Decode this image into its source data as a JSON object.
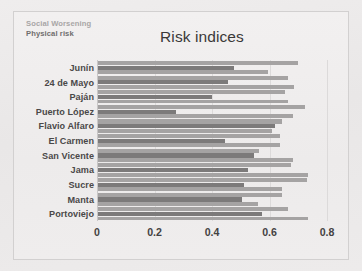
{
  "figure": {
    "title": "Risk indices",
    "legend": {
      "social_label": "Social Worsening",
      "physical_label": "Physical risk",
      "social_color": "#a5a3a3",
      "physical_color": "#7c7a7a"
    },
    "background_color": "#eceaea",
    "frame_border_color": "#d2d0d0"
  },
  "chart_data": {
    "type": "bar",
    "orientation": "horizontal",
    "title": "Risk indices",
    "xlabel": "",
    "ylabel": "",
    "xlim": [
      0,
      0.8
    ],
    "xticks": [
      "0",
      "0.2",
      "0.4",
      "0.6",
      "0.8"
    ],
    "xtick_values": [
      0,
      0.2,
      0.4,
      0.6,
      0.8
    ],
    "grid": true,
    "legend_position": "top-left",
    "categories": [
      "Junín",
      "24 de Mayo",
      "Paján",
      "Puerto López",
      "Flavio Alfaro",
      "El Carmen",
      "San Vicente",
      "Jama",
      "Sucre",
      "Manta",
      "Portoviejo"
    ],
    "series": [
      {
        "name": "Social Worsening",
        "color": "#a5a3a3",
        "values": [
          0.7,
          0.665,
          0.655,
          0.725,
          0.645,
          0.635,
          0.565,
          0.675,
          0.73,
          0.645,
          0.665
        ]
      },
      {
        "name": "Physical risk",
        "color": "#7c7a7a",
        "values": [
          0.475,
          0.455,
          0.4,
          0.275,
          0.62,
          0.445,
          0.545,
          0.525,
          0.51,
          0.505,
          0.575
        ]
      }
    ],
    "extra_bars_note": "",
    "rows": [
      {
        "category": "Junín",
        "social": 0.7,
        "physical": 0.475
      },
      {
        "category": "24 de Mayo",
        "social": 0.665,
        "physical": 0.455
      },
      {
        "category": "Paján",
        "social": 0.655,
        "physical": 0.4
      },
      {
        "category": "Puerto López",
        "social": 0.725,
        "physical": 0.275
      },
      {
        "category": "Flavio Alfaro",
        "social": 0.645,
        "physical": 0.62
      },
      {
        "category": "El Carmen",
        "social": 0.635,
        "physical": 0.445
      },
      {
        "category": "San Vicente",
        "social": 0.565,
        "physical": 0.545
      },
      {
        "category": "Jama",
        "social": 0.675,
        "physical": 0.525
      },
      {
        "category": "Sucre",
        "social": 0.73,
        "physical": 0.51
      },
      {
        "category": "Manta",
        "social": 0.645,
        "physical": 0.505
      },
      {
        "category": "Portoviejo",
        "social": 0.665,
        "physical": 0.575
      }
    ],
    "secondary_rows": [
      {
        "social": 0.595,
        "physical": 0.305
      },
      {
        "social": 0.685,
        "physical": 0.245
      },
      {
        "social": 0.665,
        "physical": 0.295
      },
      {
        "social": 0.68,
        "physical": 0.25
      },
      {
        "social": 0.61,
        "physical": 0.445
      },
      {
        "social": 0.635,
        "physical": 0.355
      },
      {
        "social": 0.68,
        "physical": 0.53
      },
      {
        "social": 0.735,
        "physical": 0.305
      },
      {
        "social": 0.645,
        "physical": 0.51
      },
      {
        "social": 0.56,
        "physical": 0.21
      },
      {
        "social": 0.735,
        "physical": 0.26
      }
    ]
  }
}
